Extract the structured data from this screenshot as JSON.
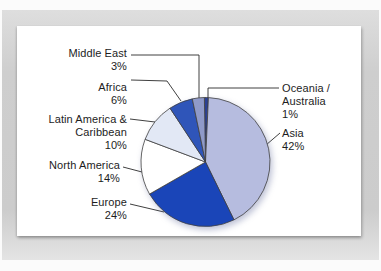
{
  "figure": {
    "kind": "scanned textbook pie chart figure",
    "mat_color": "#cecece",
    "card_color": "#ffffff",
    "text_color": "#1d1d1d"
  },
  "chart_data": {
    "type": "pie",
    "title": "",
    "units": "percent",
    "direction": "clockwise",
    "start_angle_deg": -1,
    "legend_position": "callout-labels",
    "outline_color": "#404040",
    "leader_line_color": "#2a2a2a",
    "slices": [
      {
        "name": "Oceania /\nAustralia",
        "value": 1,
        "value_label": "1%",
        "color": "#2c4193"
      },
      {
        "name": "Asia",
        "value": 42,
        "value_label": "42%",
        "color": "#b6bcdf"
      },
      {
        "name": "Europe",
        "value": 24,
        "value_label": "24%",
        "color": "#1a45b8"
      },
      {
        "name": "North America",
        "value": 14,
        "value_label": "14%",
        "color": "#ffffff"
      },
      {
        "name": "Latin America &\nCaribbean",
        "value": 10,
        "value_label": "10%",
        "color": "#e2e8f5"
      },
      {
        "name": "Africa",
        "value": 6,
        "value_label": "6%",
        "color": "#2f55b9"
      },
      {
        "name": "Middle East",
        "value": 3,
        "value_label": "3%",
        "color": "#8f9ac9"
      }
    ]
  }
}
